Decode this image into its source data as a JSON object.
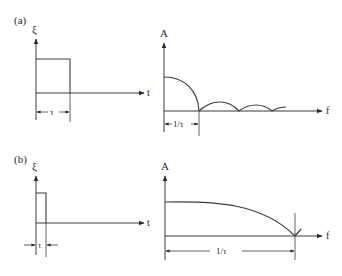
{
  "figure": {
    "panel_a": {
      "tag": "(a)",
      "time_plot": {
        "y_label": "ξ",
        "x_label": "t",
        "width_label": "τ"
      },
      "spectrum_plot": {
        "y_label": "A",
        "x_label": "f",
        "width_label": "1/τ"
      }
    },
    "panel_b": {
      "tag": "(b)",
      "time_plot": {
        "y_label": "ξ",
        "x_label": "t",
        "width_label": "τ"
      },
      "spectrum_plot": {
        "y_label": "A",
        "x_label": "f",
        "width_label": "1/τ"
      }
    },
    "colors": {
      "line": "#3a3a3a",
      "background": "#ffffff"
    }
  }
}
